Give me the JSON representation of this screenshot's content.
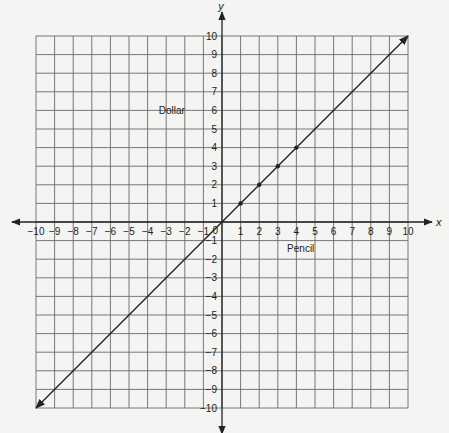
{
  "chart_data": {
    "type": "line",
    "title": "",
    "xlabel": "Pencil",
    "ylabel": "Dollar",
    "axis_x_letter": "x",
    "axis_y_letter": "y",
    "origin_label": "0",
    "xlim": [
      -10,
      10
    ],
    "ylim": [
      -10,
      10
    ],
    "grid": true,
    "x_ticks": [
      -10,
      -9,
      -8,
      -7,
      -6,
      -5,
      -4,
      -3,
      -2,
      -1,
      1,
      2,
      3,
      4,
      5,
      6,
      7,
      8,
      9,
      10
    ],
    "y_ticks": [
      -10,
      -9,
      -8,
      -7,
      -6,
      -5,
      -4,
      -3,
      -2,
      -1,
      1,
      2,
      3,
      4,
      5,
      6,
      7,
      8,
      9,
      10
    ],
    "series": [
      {
        "name": "y = x",
        "line": {
          "from": [
            -10,
            -10
          ],
          "to": [
            10,
            10
          ],
          "arrows_both_ends": true
        },
        "points": [
          [
            1,
            1
          ],
          [
            2,
            2
          ],
          [
            3,
            3
          ],
          [
            4,
            4
          ]
        ]
      }
    ],
    "annotations": [
      "Dollar",
      "Pencil",
      "circle at origin"
    ]
  },
  "colors": {
    "background": "#f4f4f2",
    "grid": "#6a6a6a",
    "axis": "#222222",
    "line": "#222222"
  }
}
